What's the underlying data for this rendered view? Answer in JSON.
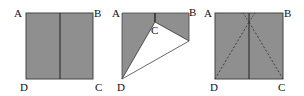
{
  "figures": [
    {
      "name": "figure-1",
      "labels": {
        "A": "A",
        "B": "B",
        "C": "C",
        "D": "D"
      }
    },
    {
      "name": "figure-2",
      "labels": {
        "A": "A",
        "B": "B",
        "C": "C",
        "D": "D"
      }
    },
    {
      "name": "figure-3",
      "labels": {
        "A": "A",
        "B": "B",
        "C": "C",
        "D": "D"
      }
    }
  ],
  "colors": {
    "fill": "#8f8f8f",
    "stroke": "#333333",
    "background": "#ffffff"
  }
}
